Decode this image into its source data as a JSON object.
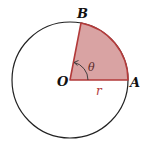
{
  "diagram": {
    "labels": {
      "center": "O",
      "point_a": "A",
      "point_b": "B",
      "angle": "θ",
      "radius": "r"
    },
    "colors": {
      "circle_stroke": "#222222",
      "sector_fill": "#d9a3a3",
      "sector_stroke": "#b23a3a",
      "label_text": "#111111",
      "radius_label": "#b23a3a"
    }
  }
}
